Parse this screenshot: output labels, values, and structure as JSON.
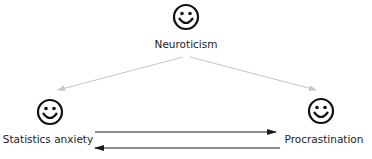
{
  "nodes": {
    "neuroticism": {
      "label": "Neuroticism",
      "icon": "smiley-face-icon"
    },
    "statistics_anxiety": {
      "label": "Statistics anxiety",
      "icon": "smiley-face-icon"
    },
    "procrastination": {
      "label": "Procrastination",
      "icon": "smiley-face-icon"
    }
  },
  "edges": [
    {
      "from": "Neuroticism",
      "to": "Statistics anxiety",
      "style": "light-gray",
      "color": "#c8c8c8"
    },
    {
      "from": "Neuroticism",
      "to": "Procrastination",
      "style": "light-gray",
      "color": "#c8c8c8"
    },
    {
      "from": "Statistics anxiety",
      "to": "Procrastination",
      "style": "solid-black",
      "color": "#1a1a1a"
    },
    {
      "from": "Procrastination",
      "to": "Statistics anxiety",
      "style": "solid-black",
      "color": "#1a1a1a"
    }
  ]
}
